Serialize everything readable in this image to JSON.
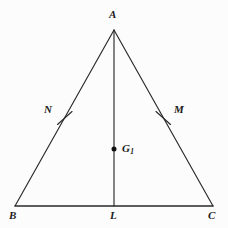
{
  "figure": {
    "name": "isosceles-triangle-with-median",
    "background_color": "#fcfcfc",
    "stroke_color": "#2a2a2a",
    "label_color": "#1b1b1b"
  },
  "labels": {
    "apex": "A",
    "bottom_left": "B",
    "bottom_right": "C",
    "base_midpoint": "L",
    "left_side_mark": "N",
    "right_side_mark": "M",
    "centroid": "G",
    "centroid_subscript": "1"
  },
  "geometry": {
    "points": {
      "A": {
        "x": 114,
        "y": 30
      },
      "B": {
        "x": 15,
        "y": 206
      },
      "C": {
        "x": 213,
        "y": 206
      },
      "L": {
        "x": 114,
        "y": 206
      },
      "N": {
        "x": 64.5,
        "y": 118
      },
      "M": {
        "x": 163.5,
        "y": 118
      },
      "G1": {
        "x": 114,
        "y": 149
      }
    },
    "segments": [
      {
        "name": "side-AB",
        "from": "A",
        "to": "B"
      },
      {
        "name": "side-AC",
        "from": "A",
        "to": "C"
      },
      {
        "name": "base-BC",
        "from": "B",
        "to": "C"
      },
      {
        "name": "median-AL",
        "from": "A",
        "to": "L"
      }
    ],
    "tick_marks": [
      {
        "name": "tick-N",
        "on_segment": "side-AB",
        "at": "N"
      },
      {
        "name": "tick-M",
        "on_segment": "side-AC",
        "at": "M"
      }
    ],
    "marked_points": [
      {
        "name": "centroid-dot",
        "at": "G1",
        "radius": 2.4
      }
    ]
  }
}
